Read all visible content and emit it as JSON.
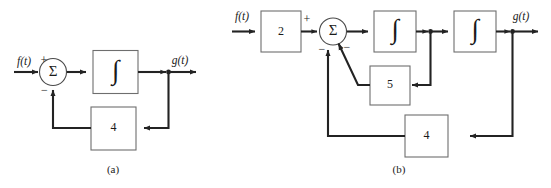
{
  "figure": {
    "background_color": "#ffffff",
    "line_color": "#232323",
    "block_stroke_color": "#6e6e6e",
    "diagrams": [
      {
        "caption": "(a)",
        "input_label": "f(t)",
        "output_label": "g(t)",
        "summing_junction": {
          "symbol": "Σ",
          "signs": [
            "+",
            "−"
          ]
        },
        "blocks": [
          {
            "label": "∫",
            "kind": "integrator"
          },
          {
            "label": "4",
            "kind": "gain"
          }
        ],
        "sign_plus": "+",
        "sign_minus": "−",
        "gain_feedback": "4",
        "integrator_symbol": "∫"
      },
      {
        "caption": "(b)",
        "input_label": "f(t)",
        "output_label": "g(t)",
        "summing_junction": {
          "symbol": "Σ",
          "signs": [
            "+",
            "−",
            "−"
          ]
        },
        "blocks": [
          {
            "label": "2",
            "kind": "gain"
          },
          {
            "label": "∫",
            "kind": "integrator"
          },
          {
            "label": "∫",
            "kind": "integrator"
          },
          {
            "label": "5",
            "kind": "gain"
          },
          {
            "label": "4",
            "kind": "gain"
          }
        ],
        "sign_plus": "+",
        "sign_minus_inner": "−",
        "sign_minus_outer": "−",
        "gain_input": "2",
        "gain_inner_feedback": "5",
        "gain_outer_feedback": "4",
        "integrator_symbol": "∫"
      }
    ]
  }
}
